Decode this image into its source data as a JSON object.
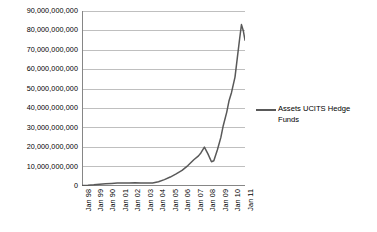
{
  "chart_data": {
    "type": "line",
    "title": "",
    "xlabel": "",
    "ylabel": "",
    "grid": true,
    "legend_position": "right",
    "ylim": [
      0,
      90000000000
    ],
    "ytick_labels": [
      "90,000,000,000",
      "80,000,000,000",
      "70,000,000,000",
      "60,000,000,000",
      "50,000,000,000",
      "40,000,000,000",
      "30,000,000,000",
      "20,000,000,000",
      "10,000,000,000",
      "0"
    ],
    "ytick_values": [
      90000000000,
      80000000000,
      70000000000,
      60000000000,
      50000000000,
      40000000000,
      30000000000,
      20000000000,
      10000000000,
      0
    ],
    "xtick_labels": [
      "Jan 98",
      "Jan 99",
      "Jan 90",
      "Jan 01",
      "Jan 02",
      "Jan 03",
      "Jan 04",
      "Jan 05",
      "Jan 06",
      "Jan 07",
      "Jan 08",
      "Jan 09",
      "Jan 10",
      "Jan 11"
    ],
    "series": [
      {
        "name": "Assets UCITS Hedge Funds",
        "color": "#595959",
        "x": [
          1998.0,
          1998.5,
          1999.0,
          1999.5,
          2000.0,
          2000.5,
          2001.0,
          2001.5,
          2002.0,
          2002.5,
          2003.0,
          2003.5,
          2004.0,
          2004.5,
          2005.0,
          2005.5,
          2006.0,
          2006.5,
          2007.0,
          2007.5,
          2007.9,
          2008.1,
          2008.4,
          2008.7,
          2009.0,
          2009.2,
          2009.5,
          2009.8,
          2010.0,
          2010.3,
          2010.5,
          2010.7,
          2011.0,
          2011.2,
          2011.4,
          2011.55,
          2011.7,
          2011.85
        ],
        "values": [
          300000000,
          400000000,
          600000000,
          900000000,
          1100000000,
          1300000000,
          1500000000,
          1500000000,
          1600000000,
          1700000000,
          1600000000,
          1500000000,
          1600000000,
          2200000000,
          3300000000,
          4600000000,
          6200000000,
          8000000000,
          10500000000,
          13500000000,
          15500000000,
          17000000000,
          20000000000,
          16500000000,
          12500000000,
          13000000000,
          18500000000,
          25000000000,
          31000000000,
          38000000000,
          44000000000,
          48000000000,
          56000000000,
          66000000000,
          76000000000,
          83000000000,
          80000000000,
          75000000000
        ]
      }
    ]
  },
  "legend": {
    "entries": [
      {
        "label": "Assets UCITS Hedge Funds",
        "color": "#595959"
      }
    ]
  },
  "colors": {
    "line": "#595959",
    "gridline": "#BFBFBF",
    "axis": "#868686",
    "background": "#FFFFFF",
    "text": "#000000"
  }
}
